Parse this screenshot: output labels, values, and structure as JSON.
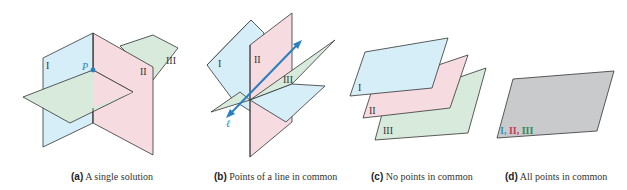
{
  "colors": {
    "plane_I": "#d6eef8",
    "plane_II": "#f6dbe1",
    "plane_III": "#d7eadb",
    "plane_all": "#c9cacb",
    "edge": "#333333",
    "accent": "#2a7fc1"
  },
  "figures": [
    {
      "id": "a",
      "tag": "(a)",
      "caption": "A single solution",
      "labels": {
        "plane1": "I",
        "plane2": "II",
        "plane3": "III",
        "point": "P"
      }
    },
    {
      "id": "b",
      "tag": "(b)",
      "caption": "Points of a line in common",
      "labels": {
        "plane1": "I",
        "plane2": "II",
        "plane3": "III",
        "line": "ℓ"
      }
    },
    {
      "id": "c",
      "tag": "(c)",
      "caption": "No points in common",
      "labels": {
        "plane1": "I",
        "plane2": "II",
        "plane3": "III"
      }
    },
    {
      "id": "d",
      "tag": "(d)",
      "caption": "All points in common",
      "labels": {
        "plane1": "I,",
        "plane2": "II,",
        "plane3": "III"
      }
    }
  ]
}
